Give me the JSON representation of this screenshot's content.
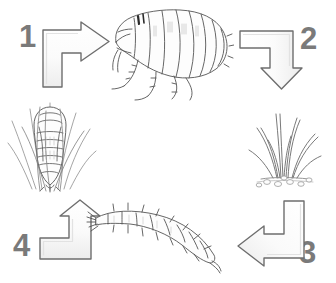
{
  "diagram": {
    "type": "cyclical-flow",
    "background_color": "#ffffff",
    "numeral_color": "#7a7a7a",
    "arrow_outline_color": "#6e6e6e",
    "arrow_fill_color": "#f7f7f7",
    "artwork_line_color": "#555555",
    "direction": "clockwise",
    "stages": [
      {
        "number": "1",
        "arrow_name": "arrow-up-right",
        "arrow_direction": "right",
        "artwork_name": "adult-flea",
        "artwork_label": "adult flea"
      },
      {
        "number": "2",
        "arrow_name": "arrow-right-down",
        "arrow_direction": "down",
        "artwork_name": "flea-eggs-in-grass",
        "artwork_label": "eggs in grass"
      },
      {
        "number": "3",
        "arrow_name": "arrow-down-left",
        "arrow_direction": "left",
        "artwork_name": "flea-larva",
        "artwork_label": "larva"
      },
      {
        "number": "4",
        "arrow_name": "arrow-left-up",
        "arrow_direction": "up",
        "artwork_name": "flea-pupa-in-grass",
        "artwork_label": "pupa in grass"
      }
    ]
  }
}
